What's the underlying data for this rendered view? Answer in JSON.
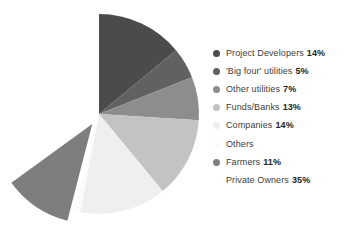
{
  "chart_data": {
    "type": "pie",
    "title": "",
    "subtitle": "",
    "xlabel": "",
    "ylabel": "",
    "legend_position": "right",
    "grid": false,
    "start_angle_deg": 0,
    "direction": "clockwise",
    "categories": [
      "Project Developers",
      "'Big four' utilities",
      "Other utilities",
      "Funds/Banks",
      "Companies",
      "Others",
      "Farmers",
      "Private Owners"
    ],
    "values": [
      14,
      5,
      7,
      13,
      14,
      1,
      11,
      35
    ],
    "value_unit": "%",
    "colors": [
      "#4b4b4b",
      "#616161",
      "#8d8d8d",
      "#c3c3c3",
      "#efefef",
      "#fbfbfb",
      "#7e7e7e",
      "#ffffff"
    ],
    "exploded_slices": [
      "Farmers"
    ],
    "slices": [
      {
        "label": "Project Developers",
        "value": 14,
        "display": "14%",
        "color": "#4b4b4b",
        "swatch": "#4b4b4b",
        "exploded": false,
        "rendered": true
      },
      {
        "label": "'Big four' utilities",
        "value": 5,
        "display": "5%",
        "color": "#616161",
        "swatch": "#616161",
        "exploded": false,
        "rendered": true
      },
      {
        "label": "Other utilities",
        "value": 7,
        "display": "7%",
        "color": "#8d8d8d",
        "swatch": "#8d8d8d",
        "exploded": false,
        "rendered": true
      },
      {
        "label": "Funds/Banks",
        "value": 13,
        "display": "13%",
        "color": "#c3c3c3",
        "swatch": "#c3c3c3",
        "exploded": false,
        "rendered": true
      },
      {
        "label": "Companies",
        "value": 14,
        "display": "14%",
        "color": "#efefef",
        "swatch": "#efefef",
        "exploded": false,
        "rendered": true
      },
      {
        "label": "Others",
        "value": 1,
        "display": "",
        "color": "#fbfbfb",
        "swatch": "#fbfbfb",
        "exploded": false,
        "rendered": true
      },
      {
        "label": "Farmers",
        "value": 11,
        "display": "11%",
        "color": "#7e7e7e",
        "swatch": "#7e7e7e",
        "exploded": true,
        "rendered": true
      },
      {
        "label": "Private Owners",
        "value": 35,
        "display": "35%",
        "color": "#ffffff",
        "swatch": "#ffffff",
        "exploded": false,
        "rendered": false
      }
    ]
  },
  "legend": {
    "items": [
      {
        "label": "Project Developers",
        "percent": "14%",
        "color": "#4b4b4b"
      },
      {
        "label": "'Big four' utilities",
        "percent": "5%",
        "color": "#616161"
      },
      {
        "label": "Other utilities",
        "percent": "7%",
        "color": "#8d8d8d"
      },
      {
        "label": "Funds/Banks",
        "percent": "13%",
        "color": "#c3c3c3"
      },
      {
        "label": "Companies",
        "percent": "14%",
        "color": "#efefef"
      },
      {
        "label": "Others",
        "percent": "",
        "color": "#fbfbfb"
      },
      {
        "label": "Farmers",
        "percent": "11%",
        "color": "#7e7e7e"
      },
      {
        "label": "Private Owners",
        "percent": "35%",
        "color": "#ffffff"
      }
    ]
  },
  "geometry": {
    "center_x": 99,
    "center_y": 114,
    "radius": 100,
    "explode_offset": 12
  }
}
